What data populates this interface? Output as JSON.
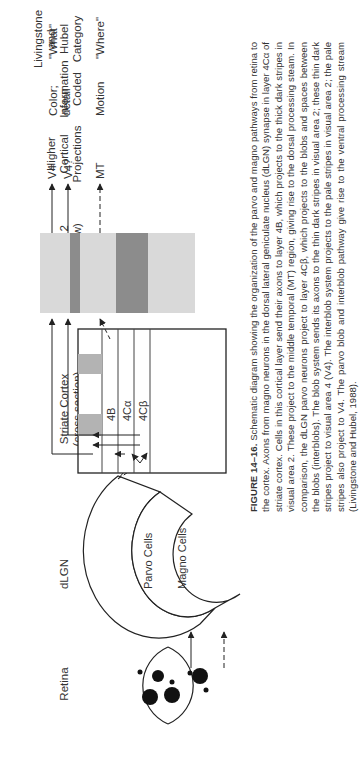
{
  "figure": {
    "column_headers": {
      "retina": "Retina",
      "dlgn": "dLGN",
      "striate": [
        "Striate Cortex",
        "(cross section)"
      ],
      "v2": [
        "Visual Area 2",
        "(surface view)"
      ],
      "projections": [
        "Higher",
        "Cortical",
        "Projections"
      ],
      "info": [
        "Information",
        "Coded"
      ],
      "category": [
        "Livingstone",
        "and",
        "Hubel",
        "Category"
      ]
    },
    "dlgn_labels": {
      "parvo": "Parvo Cells",
      "magno": "Magno Cells"
    },
    "cortex_layers": [
      "4B",
      "4Cα",
      "4Cβ"
    ],
    "projections": [
      "V4",
      "V4?",
      "MT"
    ],
    "info_coded": {
      "parvo": [
        "Color;",
        "detail"
      ],
      "magno": "Motion"
    },
    "categories": {
      "parvo": "\"What\"",
      "magno": "\"Where\""
    },
    "colors": {
      "pale_stripe": "#d9d9d9",
      "dark_stripe": "#8c8c8c",
      "blob": "#b3b3b3",
      "line": "#222222"
    }
  },
  "caption": {
    "label": "FIGURE 14–16.",
    "text": " Schematic diagram showing the organization of the parvo and magno pathways from retina to the cortex. Axons from magno neurons in the dorsal lateral geniculate nucleus (dLGN) synapse in layer 4Cα of striate cortex. Cells in this cortical layer send their axons to layer 4B, which projects to the thick dark stripes in visual area 2. These project to the middle temporal (MT) region, giving rise to the dorsal processing steam. In comparison, the dLGN parvo neurons project to layer 4Cβ, which projects to the blobs and spaces between the blobs (interblobs). The blob system sends its axons to the thin dark stripes in visual area 2; these thin dark stripes project to visual area 4 (V4). The interblob system projects to the pale stripes in visual area 2; the pale stripes also project to V4. The parvo blob and interblob pathway give rise to the ventral processing stream (Livingstone and Hubel, 1988)."
  }
}
